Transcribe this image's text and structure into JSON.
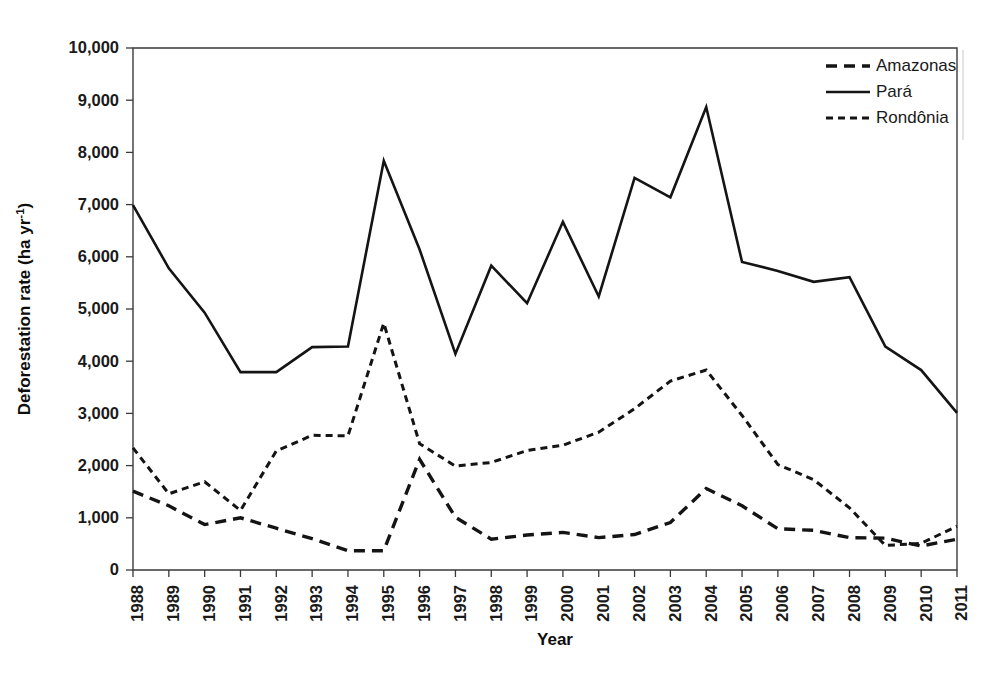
{
  "chart_data": {
    "type": "line",
    "title": "",
    "xlabel": "Year",
    "ylabel": "Deforestation rate (ha yr",
    "ylabel_superscript": "-1",
    "ylabel_suffix": ")",
    "grid": false,
    "legend_position": "top-right",
    "xlim": [
      1988,
      2011
    ],
    "ylim": [
      0,
      10000
    ],
    "ytick_values": [
      0,
      1000,
      2000,
      3000,
      4000,
      5000,
      6000,
      7000,
      8000,
      9000,
      10000
    ],
    "ytick_labels": [
      "0",
      "1,000",
      "2,000",
      "3,000",
      "4,000",
      "5,000",
      "6,000",
      "7,000",
      "8,000",
      "9,000",
      "10,000"
    ],
    "categories": [
      1988,
      1989,
      1990,
      1991,
      1992,
      1993,
      1994,
      1995,
      1996,
      1997,
      1998,
      1999,
      2000,
      2001,
      2002,
      2003,
      2004,
      2005,
      2006,
      2007,
      2008,
      2009,
      2010,
      2011
    ],
    "xtick_labels": [
      "1988",
      "1989",
      "1990",
      "1991",
      "1992",
      "1993",
      "1994",
      "1995",
      "1996",
      "1997",
      "1998",
      "1999",
      "2000",
      "2001",
      "2002",
      "2003",
      "2004",
      "2005",
      "2006",
      "2007",
      "2008",
      "2009",
      "2010",
      "2011"
    ],
    "series": [
      {
        "name": "Amazonas",
        "style": "long-dash",
        "dash_pattern": "11,7",
        "stroke_width": 3.4,
        "color": "#141414",
        "values": [
          1510,
          1230,
          870,
          1000,
          800,
          600,
          370,
          370,
          2120,
          1010,
          590,
          670,
          720,
          620,
          680,
          910,
          1560,
          1230,
          790,
          760,
          620,
          610,
          460,
          590
        ]
      },
      {
        "name": "Pará",
        "style": "solid",
        "dash_pattern": "none",
        "stroke_width": 2.6,
        "color": "#141414",
        "values": [
          6990,
          5780,
          4930,
          3790,
          3790,
          4270,
          4280,
          7840,
          6140,
          4140,
          5830,
          5110,
          6670,
          5240,
          7510,
          7140,
          8870,
          5900,
          5730,
          5520,
          5610,
          4280,
          3830,
          3010
        ]
      },
      {
        "name": "Rondônia",
        "style": "short-dash",
        "dash_pattern": "7,5",
        "stroke_width": 3.0,
        "color": "#141414",
        "values": [
          2340,
          1460,
          1690,
          1140,
          2280,
          2580,
          2570,
          4730,
          2420,
          1990,
          2060,
          2290,
          2390,
          2640,
          3090,
          3620,
          3830,
          2960,
          2020,
          1730,
          1190,
          470,
          510,
          840
        ]
      }
    ]
  },
  "legend": {
    "entries": [
      {
        "label": "Amazonas",
        "sample": "long-dash"
      },
      {
        "label": "Pará",
        "sample": "solid"
      },
      {
        "label": "Rondônia",
        "sample": "short-dash"
      }
    ]
  }
}
